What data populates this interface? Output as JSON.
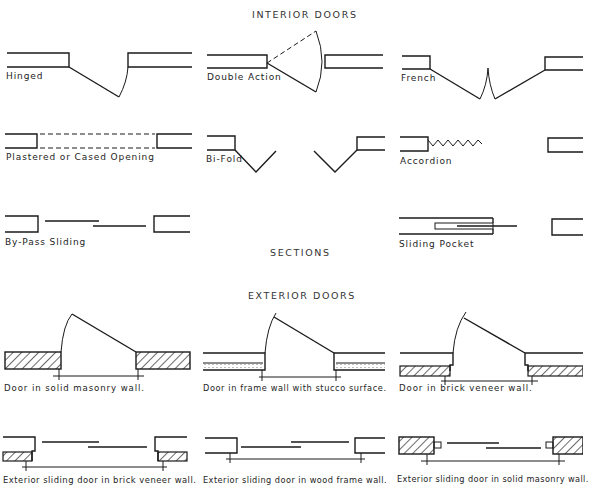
{
  "headings": {
    "interior": "INTERIOR DOORS",
    "sections": "SECTIONS",
    "exterior": "EXTERIOR DOORS"
  },
  "interior_doors": [
    {
      "id": "hinged",
      "label": "Hinged"
    },
    {
      "id": "double-action",
      "label": "Double Action"
    },
    {
      "id": "french",
      "label": "French"
    },
    {
      "id": "plastered-cased",
      "label": "Plastered or Cased Opening"
    },
    {
      "id": "bi-fold",
      "label": "Bi-Fold"
    },
    {
      "id": "accordion",
      "label": "Accordion"
    },
    {
      "id": "by-pass-sliding",
      "label": "By-Pass Sliding"
    },
    {
      "id": "sliding-pocket",
      "label": "Sliding Pocket"
    }
  ],
  "exterior_doors": [
    {
      "id": "solid-masonry",
      "label": "Door in solid masonry wall."
    },
    {
      "id": "frame-stucco",
      "label": "Door in frame wall with stucco surface."
    },
    {
      "id": "brick-veneer",
      "label": "Door in brick veneer wall."
    },
    {
      "id": "sliding-brick-veneer",
      "label": "Exterior sliding door in brick veneer wall."
    },
    {
      "id": "sliding-wood-frame",
      "label": "Exterior sliding door in wood frame wall."
    },
    {
      "id": "sliding-solid-masonry",
      "label": "Exterior sliding door in solid masonry wall."
    }
  ],
  "colors": {
    "ink": "#1a1a1a",
    "background": "#ffffff"
  }
}
